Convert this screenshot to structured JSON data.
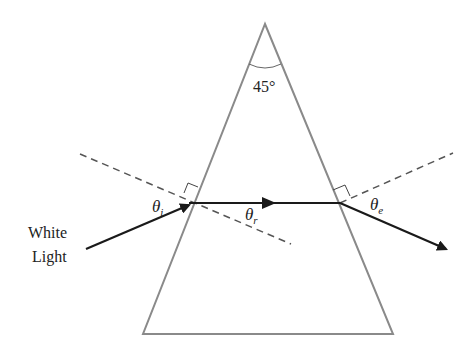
{
  "diagram": {
    "apex_angle_label": "45°",
    "source_label_line1": "White",
    "source_label_line2": "Light",
    "angle_incidence_label": "θ",
    "angle_incidence_sub": "i",
    "angle_refraction_label": "θ",
    "angle_refraction_sub": "r",
    "angle_emergence_label": "θ",
    "angle_emergence_sub": "e",
    "colors": {
      "prism_outline": "#8a8a8a",
      "ray": "#1a1a1a",
      "normal_dashed": "#555555",
      "text": "#222222"
    }
  }
}
